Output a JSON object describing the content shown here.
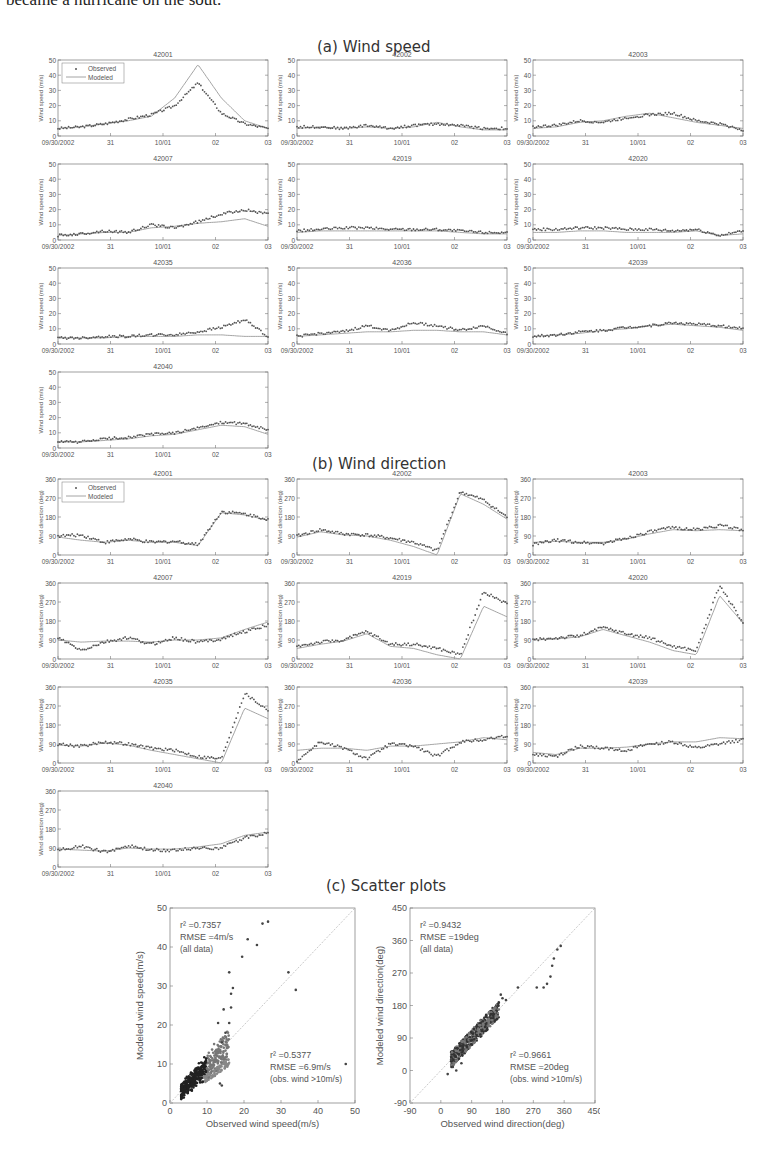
{
  "intro_text": "became a hurricane on the sout.",
  "sections": {
    "a": "(a) Wind speed",
    "b": "(b) Wind direction",
    "c": "(c) Scatter plots"
  },
  "legend": {
    "observed": "Observed",
    "modeled": "Modeled"
  },
  "x_ticks": [
    "09/30/2002",
    "31",
    "10/01",
    "02",
    "03"
  ],
  "colors": {
    "observed": "#555555",
    "modeled": "#9a9a9a",
    "axis": "#777777",
    "diag": "#bbbbbb"
  },
  "chart_data": [
    {
      "type": "line",
      "title": "(a) Wind speed",
      "ylabel": "Wind speed (m/s)",
      "ylim": [
        0,
        50
      ],
      "yticks": [
        0,
        10,
        20,
        30,
        40,
        50
      ],
      "categories": [
        "09/30/2002",
        "31",
        "10/01",
        "02",
        "03"
      ],
      "legend": [
        "Observed",
        "Modeled"
      ],
      "panels": [
        {
          "station": "42001",
          "series": [
            {
              "name": "Observed",
              "values": [
                5,
                6,
                8,
                11,
                14,
                20,
                35,
                15,
                8,
                5
              ]
            },
            {
              "name": "Modeled",
              "values": [
                5,
                6,
                8,
                10,
                13,
                25,
                47,
                25,
                10,
                5
              ]
            }
          ]
        },
        {
          "station": "42002",
          "series": [
            {
              "name": "Observed",
              "values": [
                6,
                6,
                5,
                7,
                5,
                7,
                8,
                7,
                5,
                5
              ]
            },
            {
              "name": "Modeled",
              "values": [
                5,
                6,
                5,
                6,
                5,
                6,
                9,
                6,
                4,
                4
              ]
            }
          ]
        },
        {
          "station": "42003",
          "series": [
            {
              "name": "Observed",
              "values": [
                6,
                7,
                10,
                9,
                12,
                14,
                15,
                10,
                8,
                4
              ]
            },
            {
              "name": "Modeled",
              "values": [
                5,
                6,
                9,
                10,
                13,
                15,
                12,
                9,
                7,
                5
              ]
            }
          ]
        },
        {
          "station": "42007",
          "series": [
            {
              "name": "Observed",
              "values": [
                3,
                4,
                6,
                5,
                10,
                8,
                12,
                17,
                20,
                17
              ]
            },
            {
              "name": "Modeled",
              "values": [
                3,
                4,
                5,
                5,
                8,
                9,
                11,
                12,
                14,
                9
              ]
            }
          ]
        },
        {
          "station": "42019",
          "series": [
            {
              "name": "Observed",
              "values": [
                6,
                7,
                8,
                8,
                7,
                7,
                7,
                6,
                5,
                5
              ]
            },
            {
              "name": "Modeled",
              "values": [
                5,
                6,
                6,
                6,
                6,
                6,
                6,
                5,
                4,
                4
              ]
            }
          ]
        },
        {
          "station": "42020",
          "series": [
            {
              "name": "Observed",
              "values": [
                7,
                7,
                8,
                8,
                7,
                7,
                6,
                7,
                3,
                6
              ]
            },
            {
              "name": "Modeled",
              "values": [
                5,
                5,
                6,
                6,
                5,
                5,
                5,
                6,
                3,
                4
              ]
            }
          ]
        },
        {
          "station": "42035",
          "series": [
            {
              "name": "Observed",
              "values": [
                4,
                4,
                5,
                5,
                6,
                6,
                8,
                11,
                16,
                5
              ]
            },
            {
              "name": "Modeled",
              "values": [
                4,
                4,
                4,
                5,
                5,
                5,
                6,
                6,
                5,
                5
              ]
            }
          ]
        },
        {
          "station": "42036",
          "series": [
            {
              "name": "Observed",
              "values": [
                5,
                7,
                8,
                12,
                9,
                14,
                12,
                9,
                12,
                7
              ]
            },
            {
              "name": "Modeled",
              "values": [
                5,
                6,
                7,
                8,
                8,
                9,
                9,
                8,
                8,
                6
              ]
            }
          ]
        },
        {
          "station": "42039",
          "series": [
            {
              "name": "Observed",
              "values": [
                5,
                6,
                8,
                9,
                11,
                12,
                14,
                13,
                12,
                10
              ]
            },
            {
              "name": "Modeled",
              "values": [
                5,
                6,
                7,
                9,
                10,
                12,
                13,
                12,
                11,
                9
              ]
            }
          ]
        },
        {
          "station": "42040",
          "series": [
            {
              "name": "Observed",
              "values": [
                4,
                4,
                6,
                7,
                9,
                10,
                13,
                17,
                16,
                12
              ]
            },
            {
              "name": "Modeled",
              "values": [
                4,
                4,
                5,
                6,
                8,
                9,
                12,
                15,
                14,
                9
              ]
            }
          ]
        }
      ]
    },
    {
      "type": "line",
      "title": "(b) Wind direction",
      "ylabel": "Wind direction (deg)",
      "ylim": [
        0,
        360
      ],
      "yticks": [
        0,
        90,
        180,
        270,
        360
      ],
      "categories": [
        "09/30/2002",
        "31",
        "10/01",
        "02",
        "03"
      ],
      "legend": [
        "Observed",
        "Modeled"
      ],
      "panels": [
        {
          "station": "42001",
          "series": [
            {
              "name": "Observed",
              "values": [
                90,
                95,
                60,
                75,
                60,
                65,
                50,
                205,
                195,
                170
              ]
            },
            {
              "name": "Modeled",
              "values": [
                85,
                70,
                60,
                70,
                60,
                60,
                45,
                200,
                190,
                165
              ]
            }
          ]
        },
        {
          "station": "42002",
          "series": [
            {
              "name": "Observed",
              "values": [
                90,
                120,
                100,
                95,
                80,
                60,
                20,
                300,
                260,
                180
              ]
            },
            {
              "name": "Modeled",
              "values": [
                85,
                110,
                95,
                90,
                70,
                40,
                0,
                290,
                240,
                170
              ]
            }
          ]
        },
        {
          "station": "42003",
          "series": [
            {
              "name": "Observed",
              "values": [
                50,
                70,
                60,
                55,
                80,
                110,
                130,
                120,
                140,
                120
              ]
            },
            {
              "name": "Modeled",
              "values": [
                60,
                65,
                60,
                60,
                75,
                100,
                120,
                115,
                120,
                115
              ]
            }
          ]
        },
        {
          "station": "42007",
          "series": [
            {
              "name": "Observed",
              "values": [
                100,
                40,
                80,
                100,
                70,
                100,
                80,
                95,
                130,
                160
              ]
            },
            {
              "name": "Modeled",
              "values": [
                90,
                80,
                85,
                85,
                80,
                90,
                90,
                100,
                140,
                175
              ]
            }
          ]
        },
        {
          "station": "42019",
          "series": [
            {
              "name": "Observed",
              "values": [
                60,
                80,
                90,
                130,
                70,
                70,
                50,
                20,
                320,
                260
              ]
            },
            {
              "name": "Modeled",
              "values": [
                50,
                70,
                85,
                120,
                60,
                50,
                20,
                0,
                250,
                200
              ]
            }
          ]
        },
        {
          "station": "42020",
          "series": [
            {
              "name": "Observed",
              "values": [
                90,
                100,
                110,
                150,
                120,
                100,
                60,
                40,
                350,
                170
              ]
            },
            {
              "name": "Modeled",
              "values": [
                90,
                95,
                105,
                140,
                110,
                80,
                40,
                20,
                300,
                170
              ]
            }
          ]
        },
        {
          "station": "42035",
          "series": [
            {
              "name": "Observed",
              "values": [
                90,
                80,
                100,
                90,
                70,
                60,
                30,
                20,
                330,
                250
              ]
            },
            {
              "name": "Modeled",
              "values": [
                85,
                80,
                95,
                85,
                60,
                40,
                20,
                0,
                260,
                210
              ]
            }
          ]
        },
        {
          "station": "42036",
          "series": [
            {
              "name": "Observed",
              "values": [
                10,
                100,
                70,
                20,
                90,
                80,
                30,
                100,
                110,
                130
              ]
            },
            {
              "name": "Modeled",
              "values": [
                60,
                70,
                70,
                60,
                80,
                80,
                90,
                100,
                120,
                110
              ]
            }
          ]
        },
        {
          "station": "42039",
          "series": [
            {
              "name": "Observed",
              "values": [
                40,
                30,
                80,
                70,
                60,
                90,
                100,
                70,
                90,
                110
              ]
            },
            {
              "name": "Modeled",
              "values": [
                50,
                40,
                70,
                70,
                75,
                90,
                100,
                100,
                120,
                115
              ]
            }
          ]
        },
        {
          "station": "42040",
          "series": [
            {
              "name": "Observed",
              "values": [
                80,
                100,
                70,
                100,
                80,
                80,
                90,
                90,
                140,
                160
              ]
            },
            {
              "name": "Modeled",
              "values": [
                85,
                80,
                75,
                90,
                85,
                85,
                95,
                110,
                150,
                165
              ]
            }
          ]
        }
      ]
    },
    {
      "type": "scatter",
      "title": "(c) Scatter plots",
      "xlabel": "Observed wind speed(m/s)",
      "ylabel": "Modeled wind speed(m/s)",
      "xlim": [
        0,
        50
      ],
      "ylim": [
        0,
        50
      ],
      "ticks": [
        0,
        10,
        20,
        30,
        40,
        50
      ],
      "annotations": [
        {
          "r2": "r² =0.7357",
          "rmse": "RMSE =4m/s",
          "subset": "(all data)"
        },
        {
          "r2": "r² =0.5377",
          "rmse": "RMSE =6.9m/s",
          "subset": "(obs. wind >10m/s)"
        }
      ],
      "outliers": [
        [
          25,
          46
        ],
        [
          26.5,
          46.5
        ],
        [
          21,
          42
        ],
        [
          23.5,
          40.5
        ],
        [
          19.5,
          37.5
        ],
        [
          16,
          33.5
        ],
        [
          32,
          33.5
        ],
        [
          34,
          29
        ],
        [
          17,
          29.5
        ],
        [
          16.5,
          28
        ],
        [
          14.5,
          24
        ],
        [
          16.5,
          24.5
        ],
        [
          13,
          20.5
        ],
        [
          16,
          20.5
        ],
        [
          15,
          18
        ],
        [
          14,
          15.5
        ],
        [
          47.5,
          10
        ],
        [
          13.5,
          5
        ],
        [
          14,
          4.5
        ]
      ]
    },
    {
      "type": "scatter",
      "xlabel": "Observed wind direction(deg)",
      "ylabel": "Modeled wind direction(deg)",
      "xlim": [
        -90,
        450
      ],
      "ylim": [
        -90,
        450
      ],
      "ticks": [
        -90,
        0,
        90,
        180,
        270,
        360,
        450
      ],
      "annotations": [
        {
          "r2": "r² =0.9432",
          "rmse": "RMSE =19deg",
          "subset": "(all data)"
        },
        {
          "r2": "r² =0.9661",
          "rmse": "RMSE =20deg",
          "subset": "(obs. wind >10m/s)"
        }
      ],
      "outliers": [
        [
          350,
          345
        ],
        [
          340,
          335
        ],
        [
          330,
          310
        ],
        [
          325,
          290
        ],
        [
          320,
          260
        ],
        [
          300,
          230
        ],
        [
          310,
          240
        ],
        [
          280,
          230
        ],
        [
          225,
          230
        ],
        [
          175,
          210
        ],
        [
          180,
          200
        ],
        [
          190,
          195
        ],
        [
          20,
          -10
        ],
        [
          35,
          10
        ],
        [
          45,
          0
        ],
        [
          60,
          20
        ],
        [
          30,
          30
        ]
      ]
    }
  ]
}
